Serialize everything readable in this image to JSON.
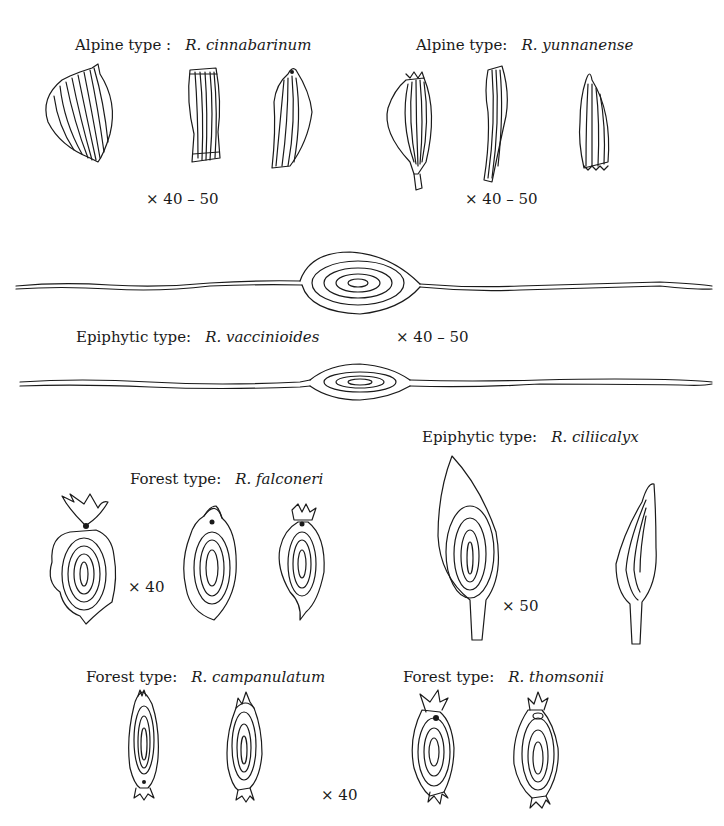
{
  "figure": {
    "panels": [
      {
        "id": "alpine-cinnabarinum",
        "type_label": "Alpine type :",
        "species": "R. cinnabarinum",
        "magnification": "× 40 – 50",
        "seed_count": 3
      },
      {
        "id": "alpine-yunnanense",
        "type_label": "Alpine type:",
        "species": "R. yunnanense",
        "magnification": "× 40 – 50",
        "seed_count": 3
      },
      {
        "id": "epiphytic-vaccinioides",
        "type_label": "Epiphytic type:",
        "species": "R. vaccinioides",
        "magnification": "× 40 – 50",
        "seed_count": 2
      },
      {
        "id": "forest-falconeri",
        "type_label": "Forest type:",
        "species": "R. falconeri",
        "magnification": "× 40",
        "seed_count": 3
      },
      {
        "id": "epiphytic-ciliicalyx",
        "type_label": "Epiphytic type:",
        "species": "R. ciliicalyx",
        "magnification": "× 50",
        "seed_count": 2
      },
      {
        "id": "forest-campanulatum",
        "type_label": "Forest type:",
        "species": "R. campanulatum",
        "magnification": "× 40",
        "seed_count": 2
      },
      {
        "id": "forest-thomsonii",
        "type_label": "Forest type:",
        "species": "R. thomsonii",
        "magnification": "",
        "seed_count": 2
      }
    ]
  },
  "colors": {
    "ink": "#1a1a1a",
    "background": "#ffffff"
  }
}
